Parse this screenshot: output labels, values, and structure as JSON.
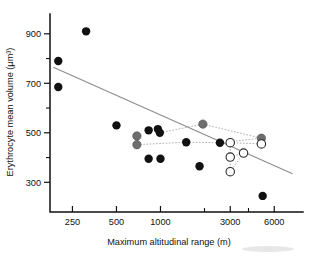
{
  "chart_data": {
    "type": "scatter",
    "title": "",
    "xlabel": "Maximum altitudinal range (m)",
    "ylabel": "Erythrocyte mean volume (µm³)",
    "xscale": "log",
    "yscale": "linear",
    "xlim": [
      150,
      9000
    ],
    "ylim": [
      180,
      980
    ],
    "grid": false,
    "legend": "none",
    "xticks": [
      250,
      500,
      1000,
      2000,
      3000,
      4000,
      6000
    ],
    "xtick_labels": [
      "250",
      "500",
      "1000",
      "",
      "3000",
      "",
      "6000"
    ],
    "yticks": [
      300,
      400,
      500,
      600,
      700,
      800,
      900
    ],
    "ytick_labels": [
      "300",
      "",
      "500",
      "",
      "700",
      "",
      "900"
    ],
    "series": [
      {
        "name": "filled",
        "marker": "filled-circle",
        "color": "#111111",
        "points": [
          {
            "x": 200,
            "y": 790
          },
          {
            "x": 200,
            "y": 685
          },
          {
            "x": 310,
            "y": 910
          },
          {
            "x": 500,
            "y": 530
          },
          {
            "x": 830,
            "y": 510
          },
          {
            "x": 960,
            "y": 515
          },
          {
            "x": 990,
            "y": 500
          },
          {
            "x": 830,
            "y": 395
          },
          {
            "x": 1000,
            "y": 395
          },
          {
            "x": 1500,
            "y": 462
          },
          {
            "x": 1850,
            "y": 365
          },
          {
            "x": 2550,
            "y": 460
          },
          {
            "x": 5000,
            "y": 245
          }
        ]
      },
      {
        "name": "gray",
        "marker": "gray-circle",
        "color": "#6e6e6e",
        "points": [
          {
            "x": 690,
            "y": 487
          },
          {
            "x": 690,
            "y": 452
          },
          {
            "x": 1950,
            "y": 535
          },
          {
            "x": 4900,
            "y": 478
          }
        ]
      },
      {
        "name": "open",
        "marker": "open-circle",
        "color": "#ffffff",
        "points": [
          {
            "x": 3000,
            "y": 460
          },
          {
            "x": 4900,
            "y": 455
          },
          {
            "x": 3000,
            "y": 402
          },
          {
            "x": 3700,
            "y": 418
          },
          {
            "x": 3000,
            "y": 343
          }
        ]
      }
    ],
    "trend_line": {
      "color": "#8c8c8c",
      "x_start": 185,
      "y_start": 765,
      "x_end": 8000,
      "y_end": 335
    },
    "connectors": [
      {
        "from": {
          "x": 690,
          "y": 452
        },
        "to": {
          "x": 1500,
          "y": 462
        }
      },
      {
        "from": {
          "x": 1500,
          "y": 462
        },
        "to": {
          "x": 2550,
          "y": 460
        }
      },
      {
        "from": {
          "x": 2550,
          "y": 460
        },
        "to": {
          "x": 4900,
          "y": 478
        }
      },
      {
        "from": {
          "x": 990,
          "y": 500
        },
        "to": {
          "x": 1950,
          "y": 535
        }
      },
      {
        "from": {
          "x": 1950,
          "y": 535
        },
        "to": {
          "x": 4900,
          "y": 478
        }
      },
      {
        "from": {
          "x": 3000,
          "y": 460
        },
        "to": {
          "x": 4900,
          "y": 455
        }
      },
      {
        "from": {
          "x": 3000,
          "y": 460
        },
        "to": {
          "x": 3000,
          "y": 402
        }
      },
      {
        "from": {
          "x": 3000,
          "y": 402
        },
        "to": {
          "x": 3700,
          "y": 418
        }
      },
      {
        "from": {
          "x": 3700,
          "y": 418
        },
        "to": {
          "x": 3000,
          "y": 343
        }
      },
      {
        "from": {
          "x": 3000,
          "y": 402
        },
        "to": {
          "x": 3000,
          "y": 343
        }
      }
    ]
  }
}
